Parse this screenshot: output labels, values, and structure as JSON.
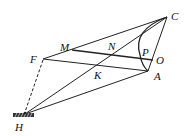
{
  "labels": {
    "C": "C",
    "M": "M",
    "N": "N",
    "P": "P",
    "O": "O",
    "F": "F",
    "K": "K",
    "A": "A",
    "H": "H"
  },
  "points": {
    "C": [
      167,
      17
    ],
    "M": [
      72,
      50
    ],
    "F": [
      43,
      59
    ],
    "A": [
      148,
      71
    ],
    "O": [
      153,
      60
    ],
    "H": [
      25,
      114
    ]
  },
  "colors": {
    "line": "#222222",
    "background": "#ffffff"
  }
}
